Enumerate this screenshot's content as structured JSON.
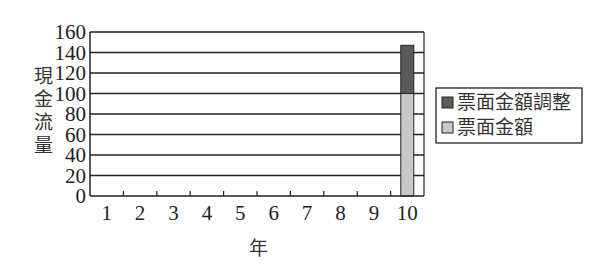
{
  "chart_data": {
    "type": "bar",
    "stacked": true,
    "title": "",
    "xlabel": "年",
    "ylabel": "現金流量",
    "categories": [
      "1",
      "2",
      "3",
      "4",
      "5",
      "6",
      "7",
      "8",
      "9",
      "10"
    ],
    "series": [
      {
        "name": "票面金額",
        "color": "#c8c8c8",
        "values": [
          0,
          0,
          0,
          0,
          0,
          0,
          0,
          0,
          0,
          100
        ]
      },
      {
        "name": "票面金額調整",
        "color": "#5a5a5a",
        "values": [
          0,
          0,
          0,
          0,
          0,
          0,
          0,
          0,
          0,
          47
        ]
      }
    ],
    "ylim": [
      0,
      160
    ],
    "yticks": [
      0,
      20,
      40,
      60,
      80,
      100,
      120,
      140,
      160
    ],
    "grid": true,
    "legend_position": "right"
  },
  "legend": {
    "items": [
      {
        "label": "票面金額調整",
        "color": "#5a5a5a"
      },
      {
        "label": "票面金額",
        "color": "#c8c8c8"
      }
    ]
  }
}
